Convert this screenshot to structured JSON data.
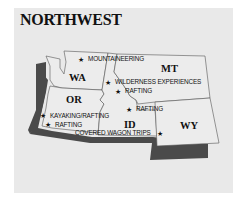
{
  "title": "NORTHWEST",
  "colors": {
    "panel_bg": "#e9e9e9",
    "state_fill": "#ececec",
    "state_stroke": "#555555",
    "route_shadow": "#4a4a4a"
  },
  "states": [
    {
      "abbr": "WA"
    },
    {
      "abbr": "OR"
    },
    {
      "abbr": "MT"
    },
    {
      "abbr": "ID"
    },
    {
      "abbr": "WY"
    }
  ],
  "activities": [
    {
      "label": "MOUNTAINEERING",
      "icon": "star-icon"
    },
    {
      "label": "WILDERNESS EXPERIENCES",
      "icon": "star-icon"
    },
    {
      "label": "RAFTING",
      "icon": "star-icon"
    },
    {
      "label": "RAFTING",
      "icon": "star-icon"
    },
    {
      "label": "KAYAKING/RAFTING",
      "icon": "star-icon"
    },
    {
      "label": "RAFTING",
      "icon": "star-icon"
    },
    {
      "label": "COVERED WAGON TRIPS",
      "icon": "star-icon"
    }
  ],
  "star_glyph": "★"
}
